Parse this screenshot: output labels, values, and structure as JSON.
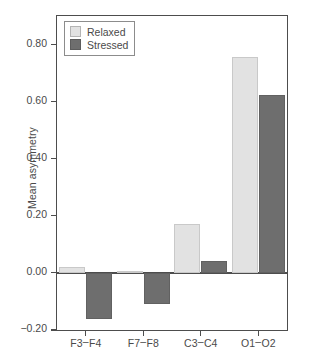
{
  "chart_data": {
    "type": "bar",
    "title": "",
    "xlabel": "",
    "ylabel": "Mean asymmetry",
    "categories": [
      "F3–F4",
      "F7–F8",
      "C3–C4",
      "O1–O2"
    ],
    "series": [
      {
        "name": "Relaxed",
        "color": "#e2e2e2",
        "values": [
          0.02,
          0.005,
          0.17,
          0.755
        ]
      },
      {
        "name": "Stressed",
        "color": "#6e6e6e",
        "values": [
          -0.16,
          -0.11,
          0.04,
          0.625
        ]
      }
    ],
    "ylim": [
      -0.2,
      0.9
    ],
    "ytick_values": [
      0.8,
      0.6,
      0.4,
      0.2,
      0.0,
      -0.2
    ],
    "ytick_labels": [
      "0.80",
      "0.60",
      "0.40",
      "0.20",
      "0.00",
      "−0.20"
    ],
    "grid": false,
    "legend_position": "top-left",
    "zero_line": true
  },
  "legend": {
    "items": [
      {
        "label": "Relaxed"
      },
      {
        "label": "Stressed"
      }
    ]
  },
  "axis": {
    "y_title": "Mean asymmetry"
  }
}
